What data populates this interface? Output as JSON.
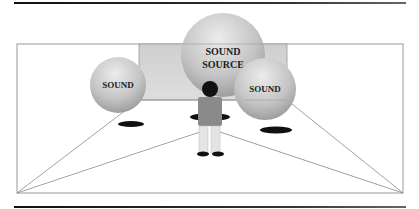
{
  "diagram": {
    "labels": {
      "sound_left": "SOUND",
      "sound_source_line1": "SOUND",
      "sound_source_line2": "SOURCE",
      "sound_right": "SOUND"
    },
    "colors": {
      "frame_line": "#9a9a9a",
      "rule_line": "#222222",
      "back_wall": "#d4d4d4",
      "sphere_light": "#e8e8e8",
      "sphere_dark": "#9c9c9c",
      "shadow": "#111111",
      "person_head": "#111111",
      "person_torso": "#8a8a8a",
      "person_legs": "#e6e6e6"
    },
    "elements": [
      "back-wall",
      "sound-sphere-left",
      "sound-source-sphere",
      "sound-sphere-right",
      "listener-figure",
      "floor-shadows"
    ]
  }
}
